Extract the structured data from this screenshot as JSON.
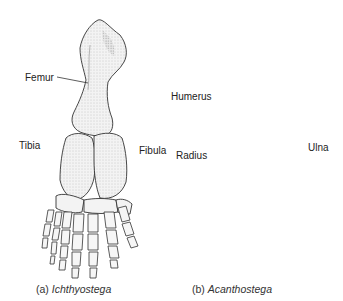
{
  "figure": {
    "panels": [
      {
        "id": "a",
        "caption_prefix": "(a)",
        "caption_taxon": "Ichthyostega",
        "limb": "hindlimb",
        "labels": [
          "Femur",
          "Tibia",
          "Fibula"
        ],
        "digits_visible": 7
      },
      {
        "id": "b",
        "caption_prefix": "(b)",
        "caption_taxon": "Acanthostega",
        "limb": "forelimb",
        "labels": [
          "Humerus",
          "Radius",
          "Ulna"
        ],
        "digits_visible": 8
      }
    ]
  },
  "labels": {
    "femur": "Femur",
    "tibia": "Tibia",
    "fibula": "Fibula",
    "humerus": "Humerus",
    "radius": "Radius",
    "ulna": "Ulna"
  },
  "captions": {
    "a_prefix": "(a) ",
    "a_taxon": "Ichthyostega",
    "b_prefix": "(b) ",
    "b_taxon": "Acanthostega"
  },
  "colors": {
    "ink": "#333333",
    "bone_fill": "#f1f1f1",
    "shade": "#cfcfcf",
    "background": "#ffffff"
  }
}
